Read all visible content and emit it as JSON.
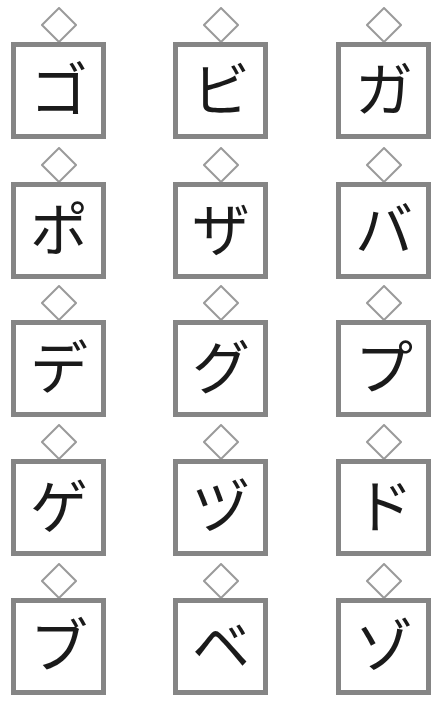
{
  "worksheet": {
    "colors": {
      "box_border": "#858585",
      "diamond_stroke": "#9a9a9a",
      "text": "#1a1a1a",
      "background": "#ffffff"
    },
    "cards": [
      {
        "kana": "ゴ"
      },
      {
        "kana": "ビ"
      },
      {
        "kana": "ガ"
      },
      {
        "kana": "ポ"
      },
      {
        "kana": "ザ"
      },
      {
        "kana": "バ"
      },
      {
        "kana": "デ"
      },
      {
        "kana": "グ"
      },
      {
        "kana": "プ"
      },
      {
        "kana": "ゲ"
      },
      {
        "kana": "ヅ"
      },
      {
        "kana": "ド"
      },
      {
        "kana": "ブ"
      },
      {
        "kana": "ベ"
      },
      {
        "kana": "ゾ"
      }
    ]
  }
}
